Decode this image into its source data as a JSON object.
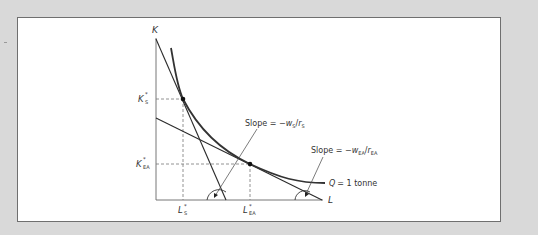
{
  "diagram": {
    "type": "isoquant-cost-minimization",
    "axes": {
      "y_label": "K",
      "x_label": "L"
    },
    "isoquant_label": {
      "var": "Q",
      "text": "= 1 tonne"
    },
    "points": [
      {
        "id": "S",
        "k_label": "K",
        "k_sup": "*",
        "k_sub": "S",
        "l_label": "L",
        "l_sup": "*",
        "l_sub": "S"
      },
      {
        "id": "EA",
        "k_label": "K",
        "k_sup": "*",
        "k_sub": "EA",
        "l_label": "L",
        "l_sup": "*",
        "l_sub": "EA"
      }
    ],
    "slope_labels": [
      {
        "prefix": "Slope = −",
        "w": "w",
        "w_sub": "S",
        "slash": "/",
        "r": "r",
        "r_sub": "S"
      },
      {
        "prefix": "Slope = −",
        "w": "w",
        "w_sub": "EA",
        "slash": "/",
        "r": "r",
        "r_sub": "EA"
      }
    ],
    "colors": {
      "background": "#d9d9d9",
      "panel": "#ffffff",
      "line": "#2b2b2b",
      "curve": "#333333",
      "dashed": "#777777"
    }
  }
}
